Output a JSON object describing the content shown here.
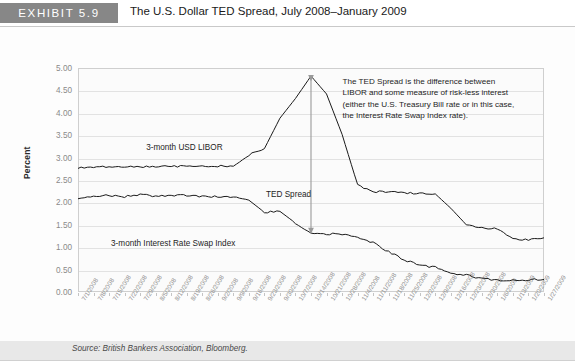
{
  "header": {
    "badge": "EXHIBIT 5.9",
    "title": "The U.S. Dollar TED Spread, July 2008–January 2009"
  },
  "source": "Source: British Bankers Association, Bloomberg.",
  "annotation": "The TED Spread is the difference between LIBOR and some measure of risk-less interest (either the U.S. Treasury Bill rate or in this case, the Interest Rate Swap Index rate).",
  "labels": {
    "libor": "3-month USD LIBOR",
    "ted": "TED Spread",
    "swap": "3-month Interest Rate Swap Index"
  },
  "colors": {
    "badge_bg": "#878787",
    "line": "#1a1a1a",
    "arrow": "#9a9a9a",
    "grid": "#e2e2e2"
  },
  "chart_data": {
    "type": "line",
    "title": "The U.S. Dollar TED Spread, July 2008–January 2009",
    "xlabel": "",
    "ylabel": "Percent",
    "ylim": [
      0.0,
      5.0
    ],
    "ytick_labels": [
      "5.00",
      "4.50",
      "4.00",
      "3.50",
      "3.00",
      "2.50",
      "2.00",
      "1.50",
      "1.00",
      "0.50",
      "0.00"
    ],
    "ytick_values": [
      5.0,
      4.5,
      4.0,
      3.5,
      3.0,
      2.5,
      2.0,
      1.5,
      1.0,
      0.5,
      0.0
    ],
    "grid": true,
    "legend": "inline-labels",
    "categories": [
      "7/1/2008",
      "7/8/2008",
      "7/15/2008",
      "7/22/2008",
      "7/29/2008",
      "8/5/2008",
      "8/12/2008",
      "8/19/2008",
      "8/26/2008",
      "9/2/2008",
      "9/9/2008",
      "9/16/2008",
      "9/23/2008",
      "9/30/2008",
      "10/7/2008",
      "10/14/2008",
      "10/21/2008",
      "10/28/2008",
      "11/4/2008",
      "11/11/2008",
      "11/18/2008",
      "11/25/2008",
      "12/2/2008",
      "12/9/2008",
      "12/16/2008",
      "12/23/2008",
      "12/30/2008",
      "1/6/2009",
      "1/13/2009",
      "1/20/2009",
      "1/27/2009"
    ],
    "series": [
      {
        "name": "3-month USD LIBOR",
        "values": [
          2.78,
          2.79,
          2.79,
          2.79,
          2.79,
          2.8,
          2.8,
          2.81,
          2.81,
          2.81,
          2.82,
          3.06,
          3.2,
          3.88,
          4.32,
          4.82,
          4.42,
          3.52,
          2.39,
          2.24,
          2.24,
          2.21,
          2.2,
          2.19,
          1.87,
          1.5,
          1.43,
          1.41,
          1.18,
          1.17,
          1.21
        ],
        "min": 1.17,
        "max": 4.82,
        "peak_date": "10/14/2008",
        "peak_value": 4.82,
        "start_value": 2.78,
        "end_value": 1.21
      },
      {
        "name": "3-month Interest Rate Swap Index",
        "values": [
          2.1,
          2.12,
          2.16,
          2.13,
          2.17,
          2.14,
          2.15,
          2.16,
          2.13,
          2.13,
          2.12,
          2.05,
          1.78,
          1.8,
          1.54,
          1.32,
          1.3,
          1.29,
          1.22,
          1.1,
          0.9,
          0.72,
          0.6,
          0.55,
          0.42,
          0.38,
          0.3,
          0.26,
          0.26,
          0.27,
          0.28
        ],
        "min": 0.26,
        "max": 2.17,
        "start_value": 2.1,
        "end_value": 0.28
      }
    ],
    "annotations": [
      {
        "text": "TED Spread",
        "kind": "double-arrow",
        "at_date": "10/14/2008",
        "from_value": 4.82,
        "to_value": 1.32
      }
    ]
  }
}
